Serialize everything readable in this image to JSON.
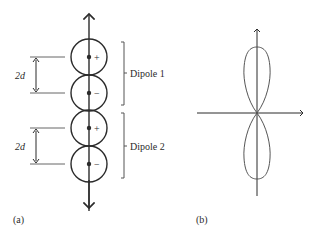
{
  "panel_a": {
    "label": "(a)",
    "spacing_labels": [
      "2d",
      "2d"
    ],
    "dipoles": [
      {
        "name": "Dipole 1",
        "charges": [
          "+",
          "−"
        ]
      },
      {
        "name": "Dipole 2",
        "charges": [
          "+",
          "−"
        ]
      }
    ]
  },
  "panel_b": {
    "label": "(b)",
    "description": "Radiation pattern: two vertical lobes along the axis"
  },
  "colors": {
    "stroke": "#2b2b2b",
    "bracket": "#555555",
    "lobe": "#555555"
  }
}
